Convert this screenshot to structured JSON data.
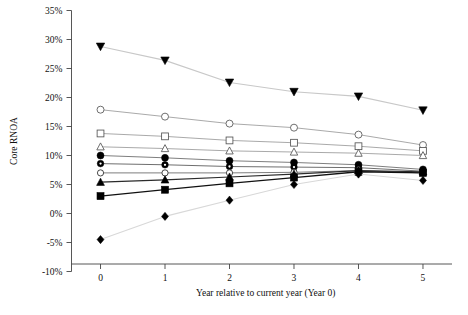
{
  "chart_data": {
    "type": "line",
    "title": "",
    "xlabel": "Year relative to current year (Year 0)",
    "ylabel": "Core RNOA",
    "x": [
      0,
      1,
      2,
      3,
      4,
      5
    ],
    "xticklabels": [
      "0",
      "1",
      "2",
      "3",
      "4",
      "5"
    ],
    "yticklabels": [
      "-10%",
      "-5%",
      "0%",
      "5%",
      "10%",
      "15%",
      "20%",
      "25%",
      "30%",
      "35%"
    ],
    "ytickvalues": [
      -10,
      -5,
      0,
      5,
      10,
      15,
      20,
      25,
      30,
      35
    ],
    "ylim": [
      -10,
      35
    ],
    "xlim": [
      -0.45,
      5.45
    ],
    "grid": false,
    "legend": "none",
    "yunit": "%",
    "series": [
      {
        "name": "Portfolio 10 (highest)",
        "marker": "triangle-down-filled",
        "color": "#000000",
        "line_color": "#c8c8c8",
        "line_width": 1.1,
        "values": [
          28.8,
          26.4,
          22.6,
          21.0,
          20.2,
          17.8
        ]
      },
      {
        "name": "Portfolio 9",
        "marker": "circle-open",
        "color": "#555555",
        "line_color": "#9a9a9a",
        "line_width": 0.85,
        "values": [
          17.9,
          16.7,
          15.5,
          14.8,
          13.6,
          11.8
        ]
      },
      {
        "name": "Portfolio 8",
        "marker": "square-open",
        "color": "#555555",
        "line_color": "#9a9a9a",
        "line_width": 0.85,
        "values": [
          13.8,
          13.3,
          12.6,
          12.2,
          11.6,
          10.8
        ]
      },
      {
        "name": "Portfolio 7",
        "marker": "triangle-up-open",
        "color": "#555555",
        "line_color": "#9a9a9a",
        "line_width": 0.85,
        "values": [
          11.5,
          11.2,
          10.8,
          10.6,
          10.4,
          10.0
        ]
      },
      {
        "name": "Portfolio 6",
        "marker": "circle-filled",
        "color": "#000000",
        "line_color": "#777777",
        "line_width": 0.95,
        "values": [
          10.0,
          9.6,
          9.1,
          8.8,
          8.4,
          7.6
        ]
      },
      {
        "name": "Portfolio 5",
        "marker": "circle-dot-filled",
        "color": "#000000",
        "line_color": "#666666",
        "line_width": 0.95,
        "values": [
          8.6,
          8.4,
          8.1,
          8.0,
          7.9,
          7.3
        ]
      },
      {
        "name": "Portfolio 4",
        "marker": "circle-open-small",
        "color": "#333333",
        "line_color": "#777777",
        "line_width": 0.95,
        "values": [
          7.0,
          7.0,
          7.0,
          7.1,
          7.4,
          7.0
        ]
      },
      {
        "name": "Portfolio 3",
        "marker": "triangle-up-filled",
        "color": "#000000",
        "line_color": "#2b2b2b",
        "line_width": 1.15,
        "values": [
          5.4,
          5.8,
          6.3,
          6.8,
          7.4,
          7.2
        ]
      },
      {
        "name": "Portfolio 2",
        "marker": "square-filled",
        "color": "#000000",
        "line_color": "#111111",
        "line_width": 1.3,
        "values": [
          3.0,
          4.1,
          5.2,
          6.2,
          7.2,
          7.0
        ]
      },
      {
        "name": "Portfolio 1 (lowest)",
        "marker": "diamond-filled",
        "color": "#000000",
        "line_color": "#d8d8d8",
        "line_width": 1.1,
        "values": [
          -4.5,
          -0.5,
          2.3,
          5.0,
          6.8,
          5.7
        ]
      }
    ]
  }
}
